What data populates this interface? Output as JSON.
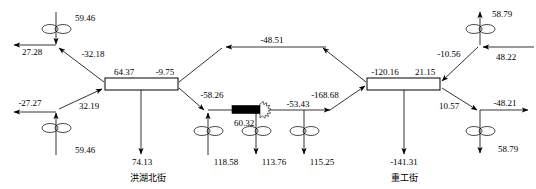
{
  "diagram": {
    "type": "traffic-network-flow-diagram",
    "background_color": "#ffffff",
    "line_color": "#000000",
    "street_labels": [
      {
        "id": "street-left",
        "text": "洪湖北街",
        "x": 148,
        "y": 178
      },
      {
        "id": "street-right",
        "text": "重工街",
        "x": 404,
        "y": 178
      }
    ],
    "links": [
      {
        "id": "link-left",
        "top_label": "64.37",
        "bottom_label": "-9.75",
        "x": 105,
        "y": 78,
        "w": 73,
        "h": 12
      },
      {
        "id": "link-right",
        "top_label": "-120.16",
        "bottom_label": "21.15",
        "x": 367,
        "y": 78,
        "w": 73,
        "h": 12
      }
    ],
    "incident": {
      "id": "incident-marker",
      "label": "60.32",
      "x": 232,
      "y": 109,
      "w": 30,
      "h": 8
    },
    "flow_labels": [
      {
        "id": "flow-nw-exit",
        "value": "27.28",
        "x": 32,
        "y": 53
      },
      {
        "id": "flow-nw-detector",
        "value": "59.46",
        "x": 85,
        "y": 19
      },
      {
        "id": "flow-nw-ramp",
        "value": "-32.18",
        "x": 93,
        "y": 55
      },
      {
        "id": "flow-sw-exit",
        "value": "-27.27",
        "x": 30,
        "y": 104
      },
      {
        "id": "flow-sw-detector",
        "value": "59.46",
        "x": 85,
        "y": 151
      },
      {
        "id": "flow-sw-ramp",
        "value": "32.19",
        "x": 89,
        "y": 107
      },
      {
        "id": "flow-left-link-top",
        "value": "64.37",
        "x": 124,
        "y": 73
      },
      {
        "id": "flow-left-link-bottom",
        "value": "-9.75",
        "x": 165,
        "y": 73
      },
      {
        "id": "flow-left-down",
        "value": "74.13",
        "x": 142,
        "y": 163
      },
      {
        "id": "flow-top-mid",
        "value": "-48.51",
        "x": 272,
        "y": 46
      },
      {
        "id": "flow-mid-ramp-down",
        "value": "-58.26",
        "x": 212,
        "y": 96
      },
      {
        "id": "flow-incident",
        "value": "60.32",
        "x": 244,
        "y": 126
      },
      {
        "id": "flow-det1-down",
        "value": "118.58",
        "x": 226,
        "y": 163
      },
      {
        "id": "flow-det2-down",
        "value": "113.76",
        "x": 274,
        "y": 163
      },
      {
        "id": "flow-mid-link",
        "value": "-53.43",
        "x": 298,
        "y": 112
      },
      {
        "id": "flow-det3-down",
        "value": "115.25",
        "x": 322,
        "y": 163
      },
      {
        "id": "flow-mid-ramp-up",
        "value": "-168.68",
        "x": 325,
        "y": 96
      },
      {
        "id": "flow-right-link-top",
        "value": "-120.16",
        "x": 385,
        "y": 73
      },
      {
        "id": "flow-right-link-bottom",
        "value": "21.15",
        "x": 425,
        "y": 73
      },
      {
        "id": "flow-right-down",
        "value": "-141.31",
        "x": 404,
        "y": 163
      },
      {
        "id": "flow-ne-ramp",
        "value": "-10.56",
        "x": 449,
        "y": 55
      },
      {
        "id": "flow-ne-detector",
        "value": "58.79",
        "x": 500,
        "y": 19
      },
      {
        "id": "flow-ne-entry",
        "value": "48.22",
        "x": 504,
        "y": 58
      },
      {
        "id": "flow-se-ramp",
        "value": "10.57",
        "x": 449,
        "y": 107
      },
      {
        "id": "flow-se-exit",
        "value": "-48.21",
        "x": 503,
        "y": 113
      },
      {
        "id": "flow-se-detector",
        "value": "58.79",
        "x": 505,
        "y": 148
      }
    ],
    "detectors": [
      {
        "id": "detector-nw",
        "x": 56,
        "y": 29
      },
      {
        "id": "detector-sw",
        "x": 56,
        "y": 128
      },
      {
        "id": "detector-mid-1",
        "x": 208,
        "y": 128
      },
      {
        "id": "detector-mid-2",
        "x": 256,
        "y": 128
      },
      {
        "id": "detector-mid-3",
        "x": 304,
        "y": 128
      },
      {
        "id": "detector-ne",
        "x": 480,
        "y": 29
      },
      {
        "id": "detector-se",
        "x": 480,
        "y": 128
      }
    ]
  }
}
